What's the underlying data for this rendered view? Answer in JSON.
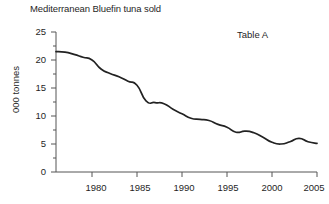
{
  "chart_data": {
    "type": "line",
    "title": "Mediterranean Bluefin tuna sold",
    "annotation": "Table A",
    "xlabel": "",
    "ylabel": "000 tonnes",
    "xlim": [
      1976,
      2005
    ],
    "ylim": [
      0,
      25
    ],
    "grid": false,
    "legend": null,
    "x_ticks": [
      "1980",
      "1985",
      "1990",
      "1995",
      "2000",
      "2005"
    ],
    "x_tick_values": [
      1980,
      1985,
      1990,
      1995,
      2000,
      2005
    ],
    "y_ticks": [
      "0",
      "5",
      "10",
      "15",
      "20",
      "25"
    ],
    "y_tick_values": [
      0,
      5,
      10,
      15,
      20,
      25
    ],
    "minor_y_tick_values": [
      2.5,
      7.5,
      12.5,
      17.5,
      22.5
    ],
    "line_color": "#222222",
    "axis_color": "#555555",
    "series": [
      {
        "name": "Mediterranean Bluefin tuna sold",
        "x": [
          1976,
          1977,
          1978,
          1979,
          1980,
          1981,
          1982,
          1983,
          1984,
          1985,
          1986,
          1987,
          1988,
          1989,
          1990,
          1991,
          1992,
          1993,
          1994,
          1995,
          1996,
          1997,
          1998,
          1999,
          2000,
          2001,
          2002,
          2003,
          2004,
          2005
        ],
        "values": [
          21.5,
          21.4,
          21.0,
          20.5,
          20.0,
          18.4,
          17.6,
          17.0,
          16.2,
          15.5,
          12.7,
          12.4,
          12.2,
          11.2,
          10.4,
          9.6,
          9.4,
          9.2,
          8.5,
          8.0,
          7.1,
          7.3,
          7.0,
          6.2,
          5.3,
          5.0,
          5.4,
          6.0,
          5.4,
          5.1
        ]
      }
    ]
  }
}
